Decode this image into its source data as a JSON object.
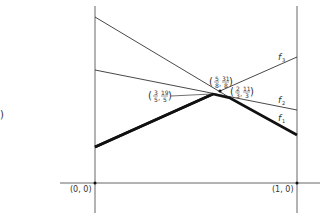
{
  "diagram": {
    "axes": {
      "origin_label": "(0, 0)",
      "right_label": "(1, 0)"
    },
    "functions": [
      {
        "name": "f",
        "sub": "1",
        "style": "thick"
      },
      {
        "name": "f",
        "sub": "2",
        "style": "thin"
      },
      {
        "name": "f",
        "sub": "3",
        "style": "thin"
      }
    ],
    "points": [
      {
        "label": "(3/5, 19/5)",
        "x_num": "3",
        "x_den": "5",
        "y_num": "19",
        "y_den": "5"
      },
      {
        "label": "(5/8, 31/8)",
        "x_num": "5",
        "x_den": "8",
        "y_num": "31",
        "y_den": "8"
      },
      {
        "label": "(2/3, 11/3)",
        "x_num": "2",
        "x_den": "3",
        "y_num": "11",
        "y_den": "3"
      }
    ],
    "left_edge_glyph": ")"
  }
}
